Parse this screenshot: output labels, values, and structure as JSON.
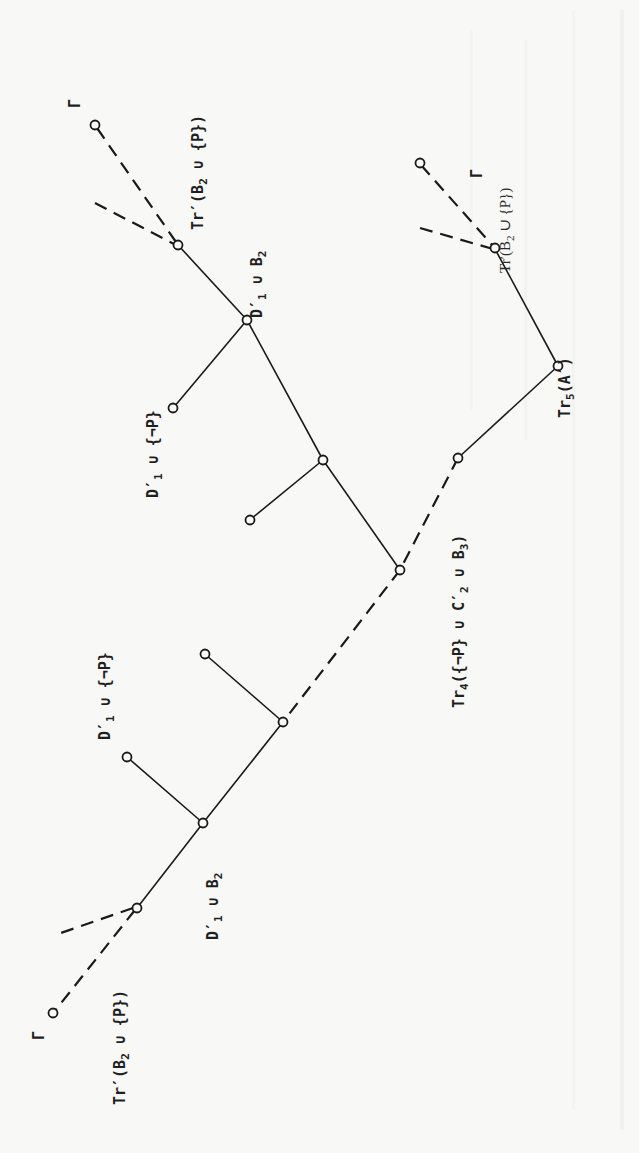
{
  "figure": {
    "orientation": "rotated 90 degrees clockwise (labels read bottom-to-top)",
    "labels": {
      "gamma_top": "Γ",
      "gamma_right": "Γ",
      "gamma_bottom": "Γ",
      "top_tr_prefix": "Tr′(B",
      "top_tr_sub": "2",
      "top_tr_suffix": " ∪ {P})",
      "top_d1_b2_prefix": "D′",
      "top_d1_b2_sub1": "1",
      "top_d1_b2_mid": " ∪ B",
      "top_d1_b2_sub2": "2",
      "mid_d1_notp_prefix": "D′",
      "mid_d1_notp_sub": "1",
      "mid_d1_notp_suffix": " ∪ {¬P}",
      "mid_d1_alone_prefix": "D′",
      "mid_d1_alone_sub": "1",
      "right_tr_prefix": "Tr′(B",
      "right_tr_sub": "2",
      "right_tr_suffix": " ∪ {P})",
      "right_tr5_prefix": "Tr",
      "right_tr5_sub": "5",
      "right_tr5_suffix": "(A′)",
      "bottom_long_prefix": "Tr",
      "bottom_long_sub1": "4",
      "bottom_long_mid1": "({¬P} ∪ C′",
      "bottom_long_sub2": "2",
      "bottom_long_mid2": " ∪ B",
      "bottom_long_sub3": "3",
      "bottom_long_suffix": ")",
      "low_d1_notp_prefix": "D′",
      "low_d1_notp_sub": "1",
      "low_d1_notp_suffix": " ∪ {¬P}",
      "low_d1_b2_prefix": "D′",
      "low_d1_b2_sub1": "1",
      "low_d1_b2_mid": " ∪ B",
      "low_d1_b2_sub2": "2",
      "bottom_tr_prefix": "Tr′(B",
      "bottom_tr_sub": "2",
      "bottom_tr_suffix": " ∪ {P})"
    }
  }
}
